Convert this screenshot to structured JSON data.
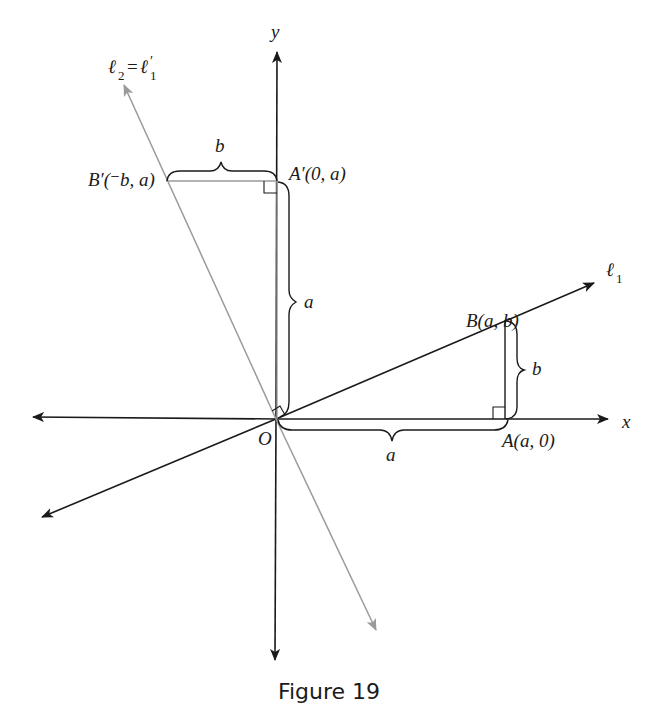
{
  "figure": {
    "caption": "Figure 19",
    "axes": {
      "x_label": "x",
      "y_label": "y",
      "origin_label": "O"
    },
    "lines": {
      "l1_label": "ℓ",
      "l1_sub": "1",
      "l2_label": "ℓ",
      "l2_sub": "2",
      "l2_eq": "=",
      "l1prime_label": "ℓ",
      "l1prime_prime": "′",
      "l1prime_sub": "1"
    },
    "points": {
      "B_label": "B(a, b)",
      "A_label": "A(a, 0)",
      "Aprime_label": "A′(0, a)",
      "Bprime_label": "B′(⁻b, a)"
    },
    "braces": {
      "horizontal_bottom": "a",
      "vertical_right": "b",
      "vertical_left": "a",
      "horizontal_top": "b"
    },
    "colors": {
      "ink": "#1a1a1a",
      "gray_line": "#9a9a9a"
    }
  }
}
